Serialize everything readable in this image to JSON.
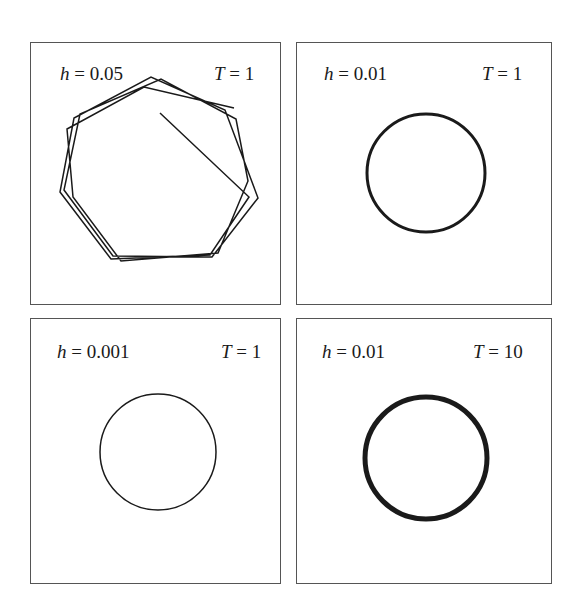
{
  "chart_data": [
    {
      "type": "line",
      "title": "",
      "panel_position": "top-left",
      "annotations": {
        "h_label": "h",
        "h_value": "0.05",
        "T_label": "T",
        "T_value": "1"
      },
      "h": 0.05,
      "T": 1,
      "description": "Numerical trajectory of a circular orbit with large step size; polyline forms several overlapping heptagon-like loops starting from interior point",
      "series": [
        {
          "name": "trajectory",
          "stroke_width": 1.5,
          "points": [
            [
              159,
              112
            ],
            [
              248,
              196
            ],
            [
              209,
              254
            ],
            [
              110,
              258
            ],
            [
              59,
              191
            ],
            [
              73,
              117
            ],
            [
              150,
              76
            ],
            [
              224,
              109
            ],
            [
              257,
              197
            ],
            [
              211,
              256
            ],
            [
              112,
              255
            ],
            [
              63,
              189
            ],
            [
              79,
              113
            ],
            [
              160,
              78
            ],
            [
              235,
              118
            ],
            [
              247,
              180
            ],
            [
              217,
              252
            ],
            [
              120,
              260
            ],
            [
              72,
              196
            ],
            [
              66,
              128
            ],
            [
              143,
              86
            ],
            [
              233,
              107
            ]
          ]
        }
      ],
      "xlabel": "",
      "ylabel": "",
      "grid": false,
      "axes": false
    },
    {
      "type": "line",
      "title": "",
      "panel_position": "top-right",
      "annotations": {
        "h_label": "h",
        "h_value": "0.01",
        "T_label": "T",
        "T_value": "1"
      },
      "h": 0.01,
      "T": 1,
      "series": [
        {
          "name": "trajectory",
          "shape": "circle",
          "center": [
            425,
            172
          ],
          "radius": 59,
          "stroke_width": 3
        }
      ],
      "xlabel": "",
      "ylabel": "",
      "grid": false,
      "axes": false
    },
    {
      "type": "line",
      "title": "",
      "panel_position": "bottom-left",
      "annotations": {
        "h_label": "h",
        "h_value": "0.001",
        "T_label": "T",
        "T_value": "1"
      },
      "h": 0.001,
      "T": 1,
      "series": [
        {
          "name": "trajectory",
          "shape": "circle",
          "center": [
            157,
            451
          ],
          "radius": 58,
          "stroke_width": 1.5
        }
      ],
      "xlabel": "",
      "ylabel": "",
      "grid": false,
      "axes": false
    },
    {
      "type": "line",
      "title": "",
      "panel_position": "bottom-right",
      "annotations": {
        "h_label": "h",
        "h_value": "0.01",
        "T_label": "T",
        "T_value": "10"
      },
      "h": 0.01,
      "T": 10,
      "series": [
        {
          "name": "trajectory",
          "shape": "circle",
          "center": [
            425,
            457
          ],
          "radius": 61,
          "stroke_width": 5
        }
      ],
      "xlabel": "",
      "ylabel": "",
      "grid": false,
      "axes": false
    }
  ],
  "panels": [
    {
      "h_sym": "h",
      "eq": " = ",
      "h_val": "0.05",
      "T_sym": "T",
      "T_eq": " = ",
      "T_val": "1"
    },
    {
      "h_sym": "h",
      "eq": " = ",
      "h_val": "0.01",
      "T_sym": "T",
      "T_eq": " = ",
      "T_val": "1"
    },
    {
      "h_sym": "h",
      "eq": " = ",
      "h_val": "0.001",
      "T_sym": "T",
      "T_eq": " = ",
      "T_val": "1"
    },
    {
      "h_sym": "h",
      "eq": " = ",
      "h_val": "0.01",
      "T_sym": "T",
      "T_eq": " = ",
      "T_val": "10"
    }
  ],
  "colors": {
    "stroke": "#1a1a1a",
    "frame": "#555555",
    "background": "#ffffff"
  }
}
